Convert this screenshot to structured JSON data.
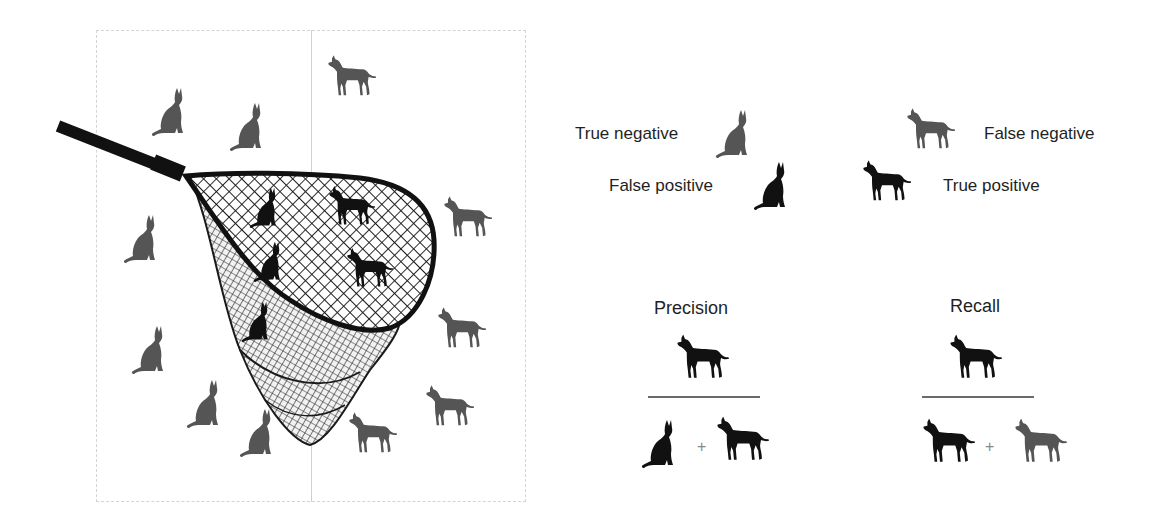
{
  "colors": {
    "negative_grey": "#555555",
    "positive_black": "#111111",
    "frame_border": "#d4d4d4",
    "fraction_line": "#6a6a6a"
  },
  "scene": {
    "description": "Fishing net catching animals; cats are negatives, dogs are positives",
    "frame_columns": [
      "cats side",
      "dogs side"
    ],
    "outside_net": {
      "grey_cats_true_negatives": 6,
      "grey_dogs_false_negatives": 5
    },
    "inside_net": {
      "black_cats_false_positives": 3,
      "black_dogs_true_positives": 2
    }
  },
  "legend": {
    "true_negative": {
      "label": "True negative",
      "icon": "grey-cat-icon"
    },
    "false_negative": {
      "label": "False negative",
      "icon": "grey-dog-icon"
    },
    "false_positive": {
      "label": "False positive",
      "icon": "black-cat-icon"
    },
    "true_positive": {
      "label": "True positive",
      "icon": "black-dog-icon"
    }
  },
  "formulas": {
    "precision": {
      "title": "Precision",
      "numerator": [
        "black-dog-icon"
      ],
      "denominator": [
        "black-cat-icon",
        "+",
        "black-dog-icon"
      ],
      "plus": "+"
    },
    "recall": {
      "title": "Recall",
      "numerator": [
        "black-dog-icon"
      ],
      "denominator": [
        "black-dog-icon",
        "+",
        "grey-dog-icon"
      ],
      "plus": "+"
    }
  }
}
